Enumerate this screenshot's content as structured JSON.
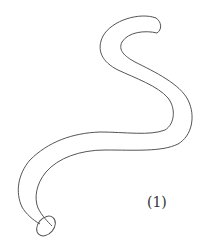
{
  "figure": {
    "label": "(1)",
    "stroke_color": "#555555",
    "background": "#ffffff"
  }
}
